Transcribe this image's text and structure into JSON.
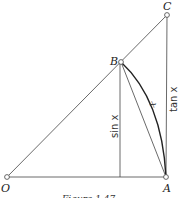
{
  "figure": {
    "caption": "Figure 1.47",
    "points": {
      "O": {
        "label": "O",
        "x": 7,
        "y": 177
      },
      "A": {
        "label": "A",
        "x": 166,
        "y": 177
      },
      "B": {
        "label": "B",
        "x": 121,
        "y": 62
      },
      "C": {
        "label": "C",
        "x": 167,
        "y": 15
      }
    },
    "labels": {
      "sin": "sin x",
      "tan": "tan x",
      "arc": "x"
    },
    "colors": {
      "line": "#444444",
      "arc": "#222222",
      "point_fill": "#ffffff"
    }
  }
}
